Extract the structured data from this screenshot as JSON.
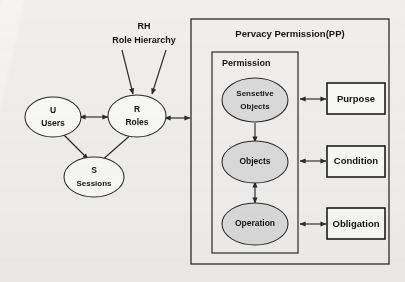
{
  "diagram": {
    "title_visible": false,
    "background_color": "#f4f3f1",
    "line_color": "#2b2b2b",
    "shaded_fill": "#dedede",
    "plain_fill": "#fdfdfc"
  },
  "annotations": {
    "role_hierarchy": {
      "line1": "RH",
      "line2": "Role Hierarchy"
    }
  },
  "rbac_nodes": [
    {
      "id": "users",
      "line1": "U",
      "line2": "Users",
      "shaded": false
    },
    {
      "id": "roles",
      "line1": "R",
      "line2": "Roles",
      "shaded": false
    },
    {
      "id": "sessions",
      "line1": "S",
      "line2": "Sessions",
      "shaded": false
    }
  ],
  "privacy_frame": {
    "title": "Pervacy Permission(PP)",
    "inner": {
      "title": "Permission",
      "nodes": [
        {
          "id": "sensetive-objects",
          "line1": "Sensetive",
          "line2": "Objects",
          "shaded": true
        },
        {
          "id": "objects",
          "line1": "Objects",
          "line2": "",
          "shaded": true
        },
        {
          "id": "operation",
          "line1": "Operation",
          "line2": "",
          "shaded": true
        }
      ]
    },
    "side_boxes": [
      {
        "id": "purpose",
        "label": "Purpose"
      },
      {
        "id": "condition",
        "label": "Condition"
      },
      {
        "id": "obligation",
        "label": "Obligation"
      }
    ]
  },
  "edges": [
    {
      "id": "users-roles",
      "type": "double-arrow"
    },
    {
      "id": "users-sessions",
      "type": "arrow"
    },
    {
      "id": "sessions-roles",
      "type": "arrow"
    },
    {
      "id": "rh-left-to-roles",
      "type": "arrow"
    },
    {
      "id": "rh-right-to-roles",
      "type": "arrow"
    },
    {
      "id": "roles-privacy-permission",
      "type": "double-arrow"
    },
    {
      "id": "sensetive-objects-objects",
      "type": "arrow"
    },
    {
      "id": "objects-operation",
      "type": "double-arrow"
    },
    {
      "id": "permission-purpose",
      "type": "double-arrow"
    },
    {
      "id": "permission-condition",
      "type": "double-arrow"
    },
    {
      "id": "permission-obligation",
      "type": "double-arrow"
    }
  ]
}
